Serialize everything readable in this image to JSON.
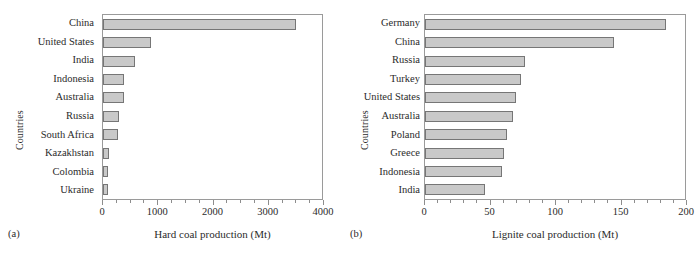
{
  "figure": {
    "background": "#ffffff",
    "bar_fill": "#c9c9c9",
    "bar_stroke": "#767676",
    "axis_color": "#9a9a9a"
  },
  "panels": [
    {
      "caption": "(a)",
      "ylabel": "Countries",
      "xlabel": "Hard coal production (Mt)",
      "xticklabels": [
        "0",
        "1000",
        "2000",
        "3000",
        "4000"
      ]
    },
    {
      "caption": "(b)",
      "ylabel": "Countries",
      "xlabel": "Lignite coal production (Mt)",
      "xticklabels": [
        "0",
        "50",
        "100",
        "150",
        "200"
      ]
    }
  ],
  "chart_data": [
    {
      "type": "bar",
      "orientation": "horizontal",
      "title": "",
      "subtitle": "",
      "panel_label": "(a)",
      "xlabel": "Hard coal production (Mt)",
      "ylabel": "Countries",
      "xlim": [
        0,
        4000
      ],
      "xticks": [
        0,
        1000,
        2000,
        3000,
        4000
      ],
      "xminor_step": 250,
      "grid": false,
      "legend": null,
      "categories": [
        "China",
        "United States",
        "India",
        "Indonesia",
        "Australia",
        "Russia",
        "South Africa",
        "Kazakhstan",
        "Colombia",
        "Ukraine"
      ],
      "values": [
        3520,
        870,
        580,
        390,
        385,
        290,
        280,
        115,
        85,
        85
      ],
      "units": "Mt"
    },
    {
      "type": "bar",
      "orientation": "horizontal",
      "title": "",
      "subtitle": "",
      "panel_label": "(b)",
      "xlabel": "Lignite coal production (Mt)",
      "ylabel": "Countries",
      "xlim": [
        0,
        200
      ],
      "xticks": [
        0,
        50,
        100,
        150,
        200
      ],
      "xminor_step": 10,
      "grid": false,
      "legend": null,
      "categories": [
        "Germany",
        "China",
        "Russia",
        "Turkey",
        "United States",
        "Australia",
        "Poland",
        "Greece",
        "Indonesia",
        "India"
      ],
      "values": [
        185,
        145,
        77,
        74,
        70,
        68,
        63,
        61,
        59,
        46
      ],
      "units": "Mt"
    }
  ]
}
